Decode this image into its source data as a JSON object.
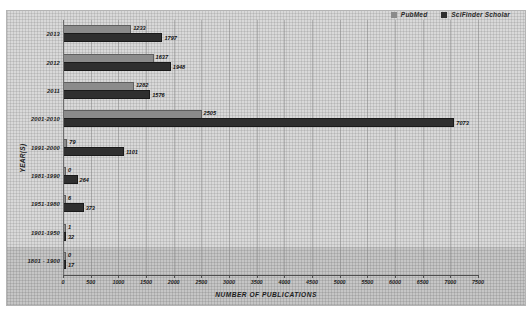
{
  "chart_data": {
    "type": "bar",
    "orientation": "horizontal",
    "title": "",
    "xlabel": "NUMBER OF PUBLICATIONS",
    "ylabel": "YEAR(S)",
    "xlim": [
      0,
      7500
    ],
    "xtick_step": 500,
    "xticks": [
      0,
      500,
      1000,
      1500,
      2000,
      2500,
      3000,
      3500,
      4000,
      4500,
      5000,
      5500,
      6000,
      6500,
      7000,
      7500
    ],
    "grid": true,
    "legend_position": "top-right",
    "categories": [
      "2013",
      "2012",
      "2011",
      "2001-2010",
      "1991-2000",
      "1981-1990",
      "1951-1980",
      "1901-1950",
      "1801 - 1900"
    ],
    "series": [
      {
        "name": "PubMed",
        "color": "#8b8b8b",
        "values": [
          1233,
          1637,
          1282,
          2505,
          79,
          0,
          6,
          1,
          0
        ]
      },
      {
        "name": "SciFinder Scholar",
        "color": "#2f2f2f",
        "values": [
          1797,
          1948,
          1576,
          7073,
          1101,
          264,
          373,
          32,
          17
        ]
      }
    ]
  },
  "legend": {
    "items": [
      {
        "label": "PubMed",
        "color": "#8b8b8b"
      },
      {
        "label": "SciFinder Scholar",
        "color": "#2f2f2f"
      }
    ]
  }
}
